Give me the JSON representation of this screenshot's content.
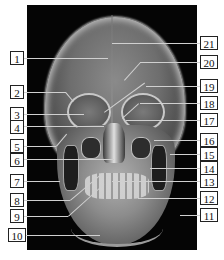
{
  "figure": {
    "type": "skull-xray-frontal-annotated",
    "labels_left": [
      {
        "number": "1",
        "y": 58
      },
      {
        "number": "2",
        "y": 92
      },
      {
        "number": "3",
        "y": 114
      },
      {
        "number": "4",
        "y": 126
      },
      {
        "number": "5",
        "y": 146
      },
      {
        "number": "6",
        "y": 159
      },
      {
        "number": "7",
        "y": 181
      },
      {
        "number": "8",
        "y": 200
      },
      {
        "number": "9",
        "y": 216
      },
      {
        "number": "10",
        "y": 235
      }
    ],
    "labels_right": [
      {
        "number": "21",
        "y": 43
      },
      {
        "number": "20",
        "y": 62
      },
      {
        "number": "19",
        "y": 86
      },
      {
        "number": "18",
        "y": 103
      },
      {
        "number": "17",
        "y": 120
      },
      {
        "number": "16",
        "y": 140
      },
      {
        "number": "15",
        "y": 154
      },
      {
        "number": "14",
        "y": 168
      },
      {
        "number": "13",
        "y": 181
      },
      {
        "number": "12",
        "y": 198
      },
      {
        "number": "11",
        "y": 215
      }
    ]
  },
  "labels": {
    "l1": "1",
    "l2": "2",
    "l3": "3",
    "l4": "4",
    "l5": "5",
    "l6": "6",
    "l7": "7",
    "l8": "8",
    "l9": "9",
    "l10": "10",
    "l11": "11",
    "l12": "12",
    "l13": "13",
    "l14": "14",
    "l15": "15",
    "l16": "16",
    "l17": "17",
    "l18": "18",
    "l19": "19",
    "l20": "20",
    "l21": "21"
  }
}
